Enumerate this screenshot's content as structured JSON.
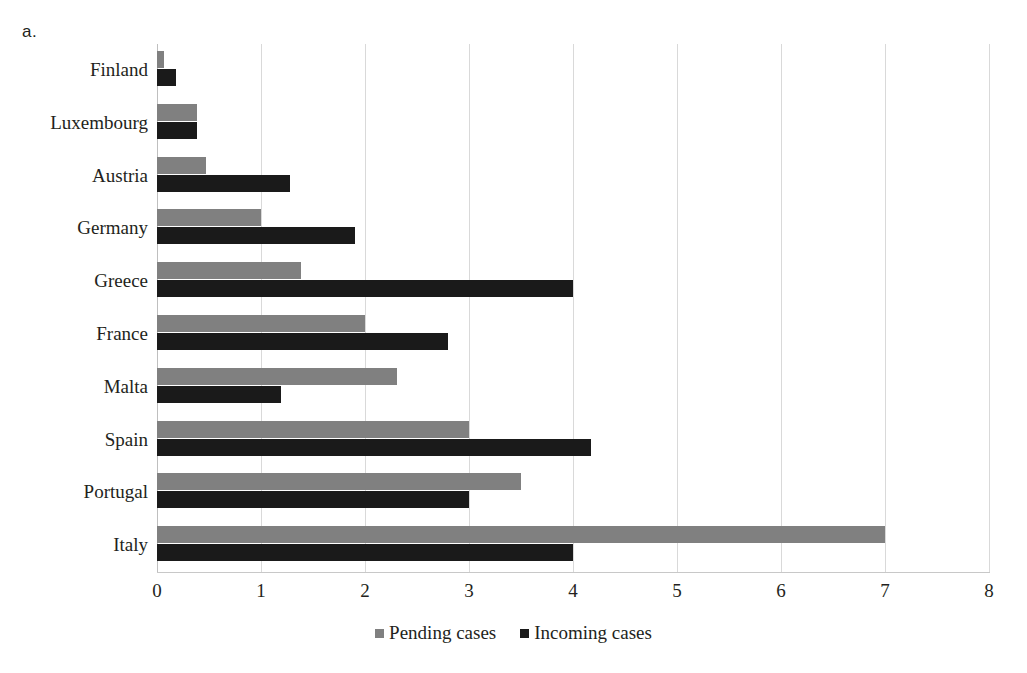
{
  "panel": {
    "label": "a."
  },
  "chart_data": {
    "type": "bar",
    "orientation": "horizontal",
    "title": "",
    "subtitle": "",
    "xlabel": "",
    "ylabel": "",
    "xlim": [
      0,
      8
    ],
    "xticks": [
      "0",
      "1",
      "2",
      "3",
      "4",
      "5",
      "6",
      "7",
      "8"
    ],
    "grid": true,
    "legend_position": "bottom",
    "categories": [
      "Finland",
      "Luxembourg",
      "Austria",
      "Germany",
      "Greece",
      "France",
      "Malta",
      "Spain",
      "Portugal",
      "Italy"
    ],
    "series": [
      {
        "name": "Pending cases",
        "color": "#808080",
        "values": [
          0.07,
          0.38,
          0.47,
          1.0,
          1.38,
          2.0,
          2.31,
          3.0,
          3.5,
          7.0
        ]
      },
      {
        "name": "Incoming cases",
        "color": "#1a1a1a",
        "values": [
          0.18,
          0.38,
          1.28,
          1.9,
          4.0,
          2.8,
          1.19,
          4.17,
          3.0,
          4.0
        ]
      }
    ]
  }
}
